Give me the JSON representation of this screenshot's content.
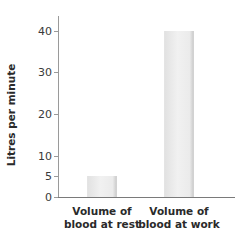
{
  "chart_data": {
    "type": "bar",
    "title": "",
    "xlabel": "",
    "ylabel": "Litres per minute",
    "categories": [
      "Volume of blood at rest",
      "Volume of blood at work"
    ],
    "category_lines": [
      [
        "Volume of",
        "blood at rest"
      ],
      [
        "Volume of",
        "blood at work"
      ]
    ],
    "values": [
      5,
      40
    ],
    "yticks": [
      0,
      5,
      10,
      20,
      30,
      40
    ],
    "ylim": [
      0,
      44
    ],
    "grid": false,
    "legend": null,
    "bar_color": "#eeeeee"
  }
}
